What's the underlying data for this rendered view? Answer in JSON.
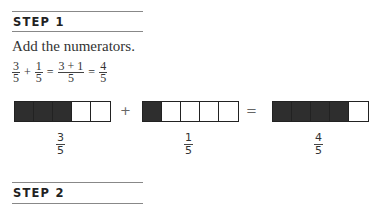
{
  "step1": {
    "title": "STEP 1",
    "instruction": "Add the numerators.",
    "equation": {
      "a": {
        "num": "3",
        "den": "5"
      },
      "op1": "+",
      "b": {
        "num": "1",
        "den": "5"
      },
      "eq1": "=",
      "c": {
        "num": "3 + 1",
        "den": "5"
      },
      "eq2": "=",
      "d": {
        "num": "4",
        "den": "5"
      }
    },
    "model": {
      "plus": "+",
      "equals": "=",
      "bars": [
        {
          "filled": 3,
          "total": 5,
          "label": {
            "num": "3",
            "den": "5"
          }
        },
        {
          "filled": 1,
          "total": 5,
          "label": {
            "num": "1",
            "den": "5"
          }
        },
        {
          "filled": 4,
          "total": 5,
          "label": {
            "num": "4",
            "den": "5"
          }
        }
      ]
    }
  },
  "step2": {
    "title": "STEP 2"
  }
}
